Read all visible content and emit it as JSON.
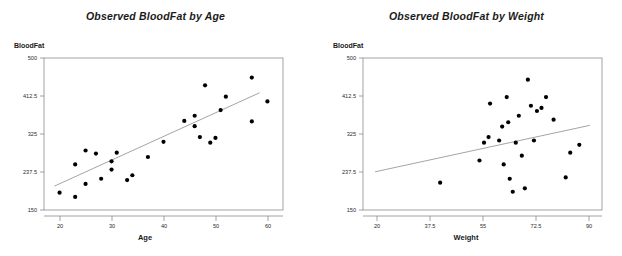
{
  "chart_data": [
    {
      "type": "scatter",
      "title": "Observed BloodFat by Age",
      "xlabel": "Age",
      "ylabel": "BloodFat",
      "xlim": [
        17,
        63
      ],
      "ylim": [
        150,
        500
      ],
      "xticks": [
        "20",
        "30",
        "40",
        "50",
        "60"
      ],
      "xtick_values": [
        20,
        30,
        40,
        50,
        60
      ],
      "yticks": [
        "500",
        "412.5",
        "325",
        "237.5",
        "150"
      ],
      "ytick_values": [
        500,
        412.5,
        325,
        237.5,
        150
      ],
      "grid": false,
      "legend": "none",
      "x": [
        20,
        23,
        23,
        25,
        25,
        27,
        28,
        30,
        30,
        31,
        33,
        34,
        37,
        40,
        44,
        46,
        46,
        47,
        48,
        49,
        50,
        51,
        52,
        57,
        57,
        60
      ],
      "y": [
        190,
        180,
        255,
        210,
        287,
        280,
        222,
        262,
        243,
        282,
        219,
        230,
        272,
        307,
        355,
        343,
        367,
        318,
        437,
        305,
        316,
        380,
        411,
        354,
        455,
        400
      ],
      "fit_line": {
        "label": "linear regression fit",
        "x0": 19.0,
        "y0": 205.0,
        "x1": 58.5,
        "y1": 420.0
      }
    },
    {
      "type": "scatter",
      "title": "Observed BloodFat by Weight",
      "xlabel": "Weight",
      "ylabel": "BloodFat",
      "xlim": [
        17,
        96
      ],
      "ylim": [
        150,
        500
      ],
      "xticks": [
        "20",
        "37.5",
        "55",
        "72.5",
        "90"
      ],
      "xtick_values": [
        20,
        37.5,
        55,
        72.5,
        90
      ],
      "yticks": [
        "500",
        "412.5",
        "325",
        "237.5",
        "150"
      ],
      "ytick_values": [
        500,
        412.5,
        325,
        237.5,
        150
      ],
      "grid": false,
      "legend": "none",
      "x": [
        42.5,
        55.5,
        57.0,
        58.5,
        59.0,
        62.0,
        63.0,
        63.5,
        64.5,
        65.0,
        65.5,
        66.5,
        67.5,
        68.5,
        69.5,
        70.5,
        71.5,
        72.5,
        73.5,
        74.5,
        76.0,
        77.5,
        80.0,
        84.0,
        85.5,
        88.5
      ],
      "y": [
        213,
        264,
        305,
        318,
        395,
        310,
        342,
        255,
        410,
        352,
        222,
        192,
        305,
        367,
        275,
        200,
        450,
        390,
        310,
        378,
        385,
        410,
        358,
        225,
        282,
        300
      ],
      "fit_line": {
        "label": "linear regression fit",
        "x0": 21.0,
        "y0": 238.0,
        "x1": 92.0,
        "y1": 345.0
      }
    }
  ]
}
